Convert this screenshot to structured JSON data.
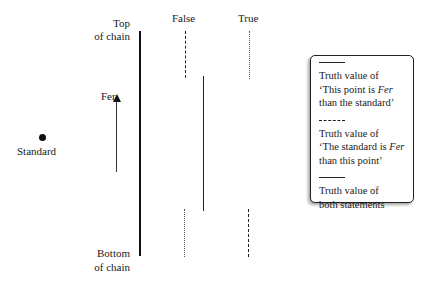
{
  "chain": {
    "top_label_1": "Top",
    "top_label_2": "of chain",
    "bottom_label_1": "Bottom",
    "bottom_label_2": "of chain"
  },
  "columns": {
    "false_label": "False",
    "true_label": "True"
  },
  "standard": {
    "label": "Standard"
  },
  "arrow": {
    "label": "Fer"
  },
  "legend": {
    "items": [
      {
        "line_style": "solid",
        "text_1": "Truth value of",
        "text_2a": "‘This point is ",
        "text_2b": "Fer",
        "text_3": "than the standard’"
      },
      {
        "line_style": "dashed",
        "text_1": "Truth value of",
        "text_2a": "‘The standard is ",
        "text_2b": "Fer",
        "text_3": "than this point’"
      },
      {
        "line_style": "solid",
        "text_1": "Truth value of",
        "text_2": "both statements"
      }
    ]
  }
}
